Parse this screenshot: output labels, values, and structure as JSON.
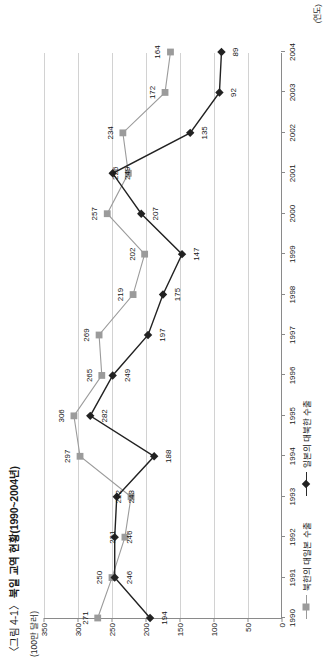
{
  "figure": {
    "caption_prefix": "〈그림 4-1〉",
    "caption_title": "북일 교역 현황(1990~2004년)",
    "unit_label": "(100만 달러)",
    "x_unit_label": "(연도)"
  },
  "legend": {
    "items": [
      {
        "label": "북한의 대일본 수출",
        "marker": "square-marker",
        "color": "#9b9b9b"
      },
      {
        "label": "일본의 대북한 수출",
        "marker": "diamond-marker",
        "color": "#222222"
      }
    ]
  },
  "chart_data": {
    "type": "line",
    "title": "〈그림 4-1〉 북일 교역 현황(1990~2004년)",
    "xlabel": "(연도)",
    "ylabel": "(100만 달러)",
    "ylim": [
      0,
      350
    ],
    "yticks": [
      0,
      50,
      100,
      150,
      200,
      250,
      300,
      350
    ],
    "grid": true,
    "legend_position": "bottom",
    "categories": [
      1990,
      1991,
      1992,
      1993,
      1994,
      1995,
      1996,
      1997,
      1998,
      1999,
      2000,
      2001,
      2002,
      2003,
      2004
    ],
    "series": [
      {
        "name": "북한의 대일본 수출",
        "color": "#9b9b9b",
        "marker": "square",
        "values": [
          271,
          250,
          231,
          222,
          297,
          306,
          265,
          269,
          219,
          202,
          257,
          226,
          234,
          172,
          164
        ]
      },
      {
        "name": "일본의 대북한 수출",
        "color": "#222222",
        "marker": "diamond",
        "values": [
          194,
          246,
          246,
          243,
          188,
          282,
          249,
          197,
          175,
          147,
          207,
          249,
          135,
          92,
          89
        ]
      }
    ]
  }
}
